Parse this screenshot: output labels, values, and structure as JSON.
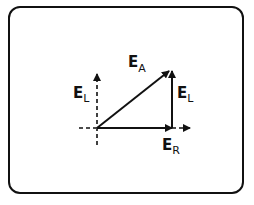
{
  "diagram": {
    "title": "",
    "labels": {
      "ea_main": "E",
      "ea_sub": "A",
      "el_left_main": "E",
      "el_left_sub": "L",
      "el_right_main": "E",
      "el_right_sub": "L",
      "er_main": "E",
      "er_sub": "R"
    },
    "vectors": [
      {
        "name": "E_R",
        "style": "solid",
        "direction": "horizontal"
      },
      {
        "name": "E_L",
        "style": "solid",
        "direction": "vertical"
      },
      {
        "name": "E_A",
        "style": "solid",
        "direction": "diagonal"
      },
      {
        "name": "E_L (reference axis)",
        "style": "dashed",
        "direction": "vertical"
      },
      {
        "name": "horizontal reference axis",
        "style": "dashed",
        "direction": "horizontal"
      }
    ],
    "colors": {
      "ink": "#111111",
      "background": "#ffffff"
    }
  }
}
